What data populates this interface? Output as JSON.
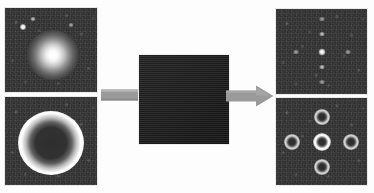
{
  "figure": {
    "caption": "",
    "background_color": "#fdfdfd",
    "panel_background_color": "#2e2e2e",
    "arrow_color": "#9a9a9a",
    "highlight_color": "#ffffff"
  },
  "panels": {
    "input_gaussian": {
      "label": "input-gaussian-source",
      "description": "noisy dark field with bright unresolved gaussian source and faint speckles",
      "features": [
        {
          "name": "gaussian-core",
          "x_pct": 52,
          "y_pct": 56,
          "w_px": 52,
          "h_px": 50,
          "peak": "#ffffff"
        },
        {
          "name": "speckle-bright",
          "x_pct": 20,
          "y_pct": 23,
          "w_px": 6,
          "h_px": 6,
          "peak": "#ffffff"
        },
        {
          "name": "speckle-faint-a",
          "x_pct": 30,
          "y_pct": 13,
          "w_px": 5,
          "h_px": 4,
          "peak": "#cfcfcf"
        },
        {
          "name": "speckle-faint-b",
          "x_pct": 72,
          "y_pct": 20,
          "w_px": 5,
          "h_px": 4,
          "peak": "#b4b4b4"
        }
      ]
    },
    "input_annulus": {
      "label": "input-annulus-source",
      "description": "noisy dark field with a bright annular (ring) intensity distribution",
      "features": [
        {
          "name": "annulus-ring",
          "x_pct": 50,
          "y_pct": 52,
          "w_px": 66,
          "h_px": 64,
          "peak": "#ffffff"
        }
      ]
    },
    "mask_grid": {
      "label": "periodic-aperture-mask",
      "description": "regular square lattice of transmissive elements on an opaque substrate",
      "cells_x": 22,
      "cells_y": 22,
      "cell_pitch_px": 4.1,
      "cell_size_px": 2.6,
      "cell_color": "#ffffff",
      "substrate_color": "#1e1e1e"
    },
    "output_gaussian": {
      "label": "output-gaussian-diffraction",
      "description": "dark field with a bright central point and faint replica orders in a cross pattern",
      "features": [
        {
          "name": "order-0",
          "x_pct": 50,
          "y_pct": 50,
          "kind": "dot-main"
        },
        {
          "name": "order-up",
          "x_pct": 50,
          "y_pct": 29,
          "kind": "dot-sat"
        },
        {
          "name": "order-down",
          "x_pct": 50,
          "y_pct": 68,
          "kind": "dot-sat"
        },
        {
          "name": "order-left",
          "x_pct": 22,
          "y_pct": 50,
          "kind": "dot-sat2"
        },
        {
          "name": "order-right",
          "x_pct": 79,
          "y_pct": 50,
          "kind": "dot-sat2"
        },
        {
          "name": "order-up-far",
          "x_pct": 50,
          "y_pct": 12,
          "kind": "dot-sat2"
        },
        {
          "name": "order-dn-far",
          "x_pct": 50,
          "y_pct": 86,
          "kind": "dot-sat2"
        }
      ]
    },
    "output_annulus": {
      "label": "output-annulus-diffraction",
      "description": "dark field with a bright central ring and four dimmer replica rings up, down, left and right",
      "features": [
        {
          "name": "ring-order-0",
          "x_pct": 50,
          "y_pct": 50,
          "kind": "ring-main"
        },
        {
          "name": "ring-order-up",
          "x_pct": 50,
          "y_pct": 22,
          "kind": "ring-sat"
        },
        {
          "name": "ring-order-down",
          "x_pct": 50,
          "y_pct": 79,
          "kind": "ring-sat"
        },
        {
          "name": "ring-order-left",
          "x_pct": 18,
          "y_pct": 50,
          "kind": "ring-sat"
        },
        {
          "name": "ring-order-right",
          "x_pct": 82,
          "y_pct": 50,
          "kind": "ring-sat"
        }
      ]
    }
  },
  "arrows": {
    "left": {
      "label": "flow-arrow-into-mask",
      "direction": "right",
      "color": "#9a9a9a",
      "has_head": false
    },
    "right": {
      "label": "flow-arrow-out-of-mask",
      "direction": "right",
      "color": "#9a9a9a",
      "has_head": true
    }
  }
}
